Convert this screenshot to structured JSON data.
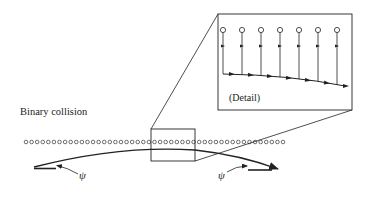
{
  "diagram": {
    "title": "Binary collision",
    "inset_label": "(Detail)",
    "angle_symbol_left": "ψ",
    "angle_symbol_right": "ψ",
    "colors": {
      "stroke": "#222222",
      "background": "#ffffff"
    },
    "atom_row": {
      "y": 142,
      "x_start": 26,
      "x_end": 283,
      "count": 47,
      "radius": 1.8
    },
    "inset_atoms": {
      "x": [
        223,
        242,
        261,
        280,
        299,
        318,
        337
      ],
      "circle_y": 30,
      "tick_y": 46
    },
    "zoom_box": {
      "x": 151,
      "y": 129,
      "w": 44,
      "h": 32
    },
    "inset_box": {
      "x": 218,
      "y": 14,
      "w": 134,
      "h": 96
    }
  }
}
